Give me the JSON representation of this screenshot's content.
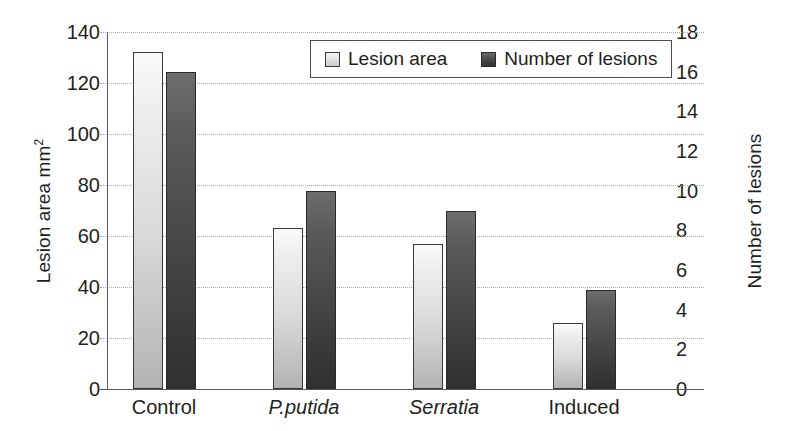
{
  "chart_data": {
    "type": "bar",
    "title": "",
    "categories": [
      "Control",
      "P.putida",
      "Serratia",
      "Induced"
    ],
    "categories_italic": [
      false,
      true,
      true,
      false
    ],
    "series": [
      {
        "name": "Lesion area",
        "axis": "left",
        "values": [
          132,
          63,
          57,
          26
        ],
        "color": "#d9d9d9"
      },
      {
        "name": "Number of lesions",
        "axis": "right",
        "values": [
          16,
          10,
          9,
          5
        ],
        "color": "#474747"
      }
    ],
    "xlabel": "",
    "ylabel": "Lesion area mm2",
    "ylabel_right": "Number of lesions",
    "ylim": [
      0,
      140
    ],
    "ylim_right": [
      0,
      18
    ],
    "yticks": [
      0,
      20,
      40,
      60,
      80,
      100,
      120,
      140
    ],
    "yticks_right": [
      0,
      2,
      4,
      6,
      8,
      10,
      12,
      14,
      16,
      18
    ],
    "grid": true,
    "legend_position": "top-center"
  },
  "axes": {
    "left": {
      "title_main": "Lesion area mm",
      "title_sup": "2",
      "ticks": [
        "140",
        "120",
        "100",
        "80",
        "60",
        "40",
        "20",
        "0"
      ]
    },
    "right": {
      "title": "Number of lesions",
      "ticks": [
        "18",
        "16",
        "14",
        "12",
        "10",
        "8",
        "6",
        "4",
        "2",
        "0"
      ]
    }
  },
  "legend": {
    "items": [
      {
        "label": "Lesion area",
        "swatch": "light-gray-square"
      },
      {
        "label": "Number of lesions",
        "swatch": "dark-gray-square"
      }
    ]
  },
  "categories": [
    {
      "label": "Control",
      "italic": false
    },
    {
      "label": "P.putida",
      "italic": true
    },
    {
      "label": "Serratia",
      "italic": true
    },
    {
      "label": "Induced",
      "italic": false
    }
  ],
  "colors": {
    "bar_light": "#d9d9d9",
    "bar_dark": "#474747",
    "gridline": "#a8a8a8",
    "axis_line": "#58595b",
    "text": "#231f20",
    "background": "#ffffff"
  }
}
